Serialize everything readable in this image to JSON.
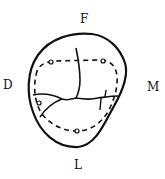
{
  "figure": {
    "type": "tooth occlusal outline diagram",
    "labels": {
      "top": "F",
      "left": "D",
      "right": "M",
      "bottom": "L"
    },
    "colors": {
      "stroke": "#111111",
      "background": "#ffffff"
    },
    "elements": {
      "outline": "solid crown outline",
      "marginal_ridge_loop": "dashed inner loop",
      "cusp_tips": [
        {
          "x": 51,
          "y": 62
        },
        {
          "x": 103,
          "y": 61
        },
        {
          "x": 39,
          "y": 103
        },
        {
          "x": 77,
          "y": 131
        }
      ],
      "grooves": [
        "central vertical groove",
        "horizontal groove",
        "oblique distal groove",
        "mesial short grooves"
      ]
    }
  }
}
